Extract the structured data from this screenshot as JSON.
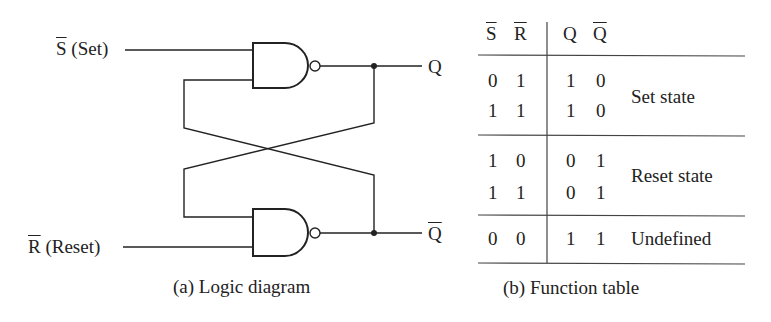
{
  "logic_diagram": {
    "inputs": [
      {
        "symbol": "S",
        "overbar": true,
        "name": "(Set)"
      },
      {
        "symbol": "R",
        "overbar": true,
        "name": "(Reset)"
      }
    ],
    "outputs": [
      {
        "symbol": "Q",
        "overbar": false
      },
      {
        "symbol": "Q",
        "overbar": true
      }
    ],
    "gates": [
      "NAND",
      "NAND"
    ],
    "caption": "(a) Logic diagram"
  },
  "function_table": {
    "headers": [
      {
        "symbol": "S",
        "overbar": true
      },
      {
        "symbol": "R",
        "overbar": true
      },
      {
        "symbol": "Q",
        "overbar": false
      },
      {
        "symbol": "Q",
        "overbar": true
      }
    ],
    "groups": [
      {
        "label": "Set state",
        "rows": [
          [
            "0",
            "1",
            "1",
            "0"
          ],
          [
            "1",
            "1",
            "1",
            "0"
          ]
        ]
      },
      {
        "label": "Reset state",
        "rows": [
          [
            "1",
            "0",
            "0",
            "1"
          ],
          [
            "1",
            "1",
            "0",
            "1"
          ]
        ]
      },
      {
        "label": "Undefined",
        "rows": [
          [
            "0",
            "0",
            "1",
            "1"
          ]
        ]
      }
    ],
    "caption": "(b) Function table"
  }
}
